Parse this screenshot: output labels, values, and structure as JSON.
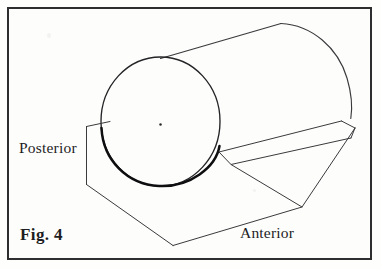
{
  "figure": {
    "caption": "Fig. 4",
    "labels": {
      "posterior": "Posterior",
      "anterior": "Anterior"
    },
    "colors": {
      "background": "#fdfdfc",
      "frame": "#2e2e30",
      "line": "#3a3a3c",
      "line_heavy": "#101012",
      "text": "#1d1d1f"
    },
    "frame": {
      "x": 7,
      "y": 7,
      "width": 365,
      "height": 253,
      "stroke_width": 2
    },
    "geometry": {
      "near_end_circle": {
        "cx": 160.5,
        "cy": 121.5,
        "rx": 59.5,
        "ry": 64.5
      },
      "center_dot": {
        "cx": 160.5,
        "cy": 124.5,
        "r": 1.2
      },
      "top_silhouette": {
        "x1": 160,
        "y1": 58,
        "x2": 281,
        "y2": 23
      },
      "far_end_arc": {
        "start": "281,23",
        "end": "351,117",
        "rx": 46,
        "ry": 62
      },
      "lower_silhouette": {
        "x1": 219,
        "y1": 152,
        "x2": 341,
        "y2": 121
      },
      "trough": {
        "left_tab_top": "86,126 110,121",
        "left_edge": "86,126 86,184",
        "left_lower_fold": "86,184 173,245",
        "bottom_vertex": "173,245",
        "front_lower_edge": "173,245 302,207 355,128",
        "inner_fold": "219,152 231,164 351,138",
        "right_corner": "355,128",
        "rim_band_top": "219,152 341,121 355,128",
        "back_fold": "231,164 355,128"
      }
    }
  }
}
